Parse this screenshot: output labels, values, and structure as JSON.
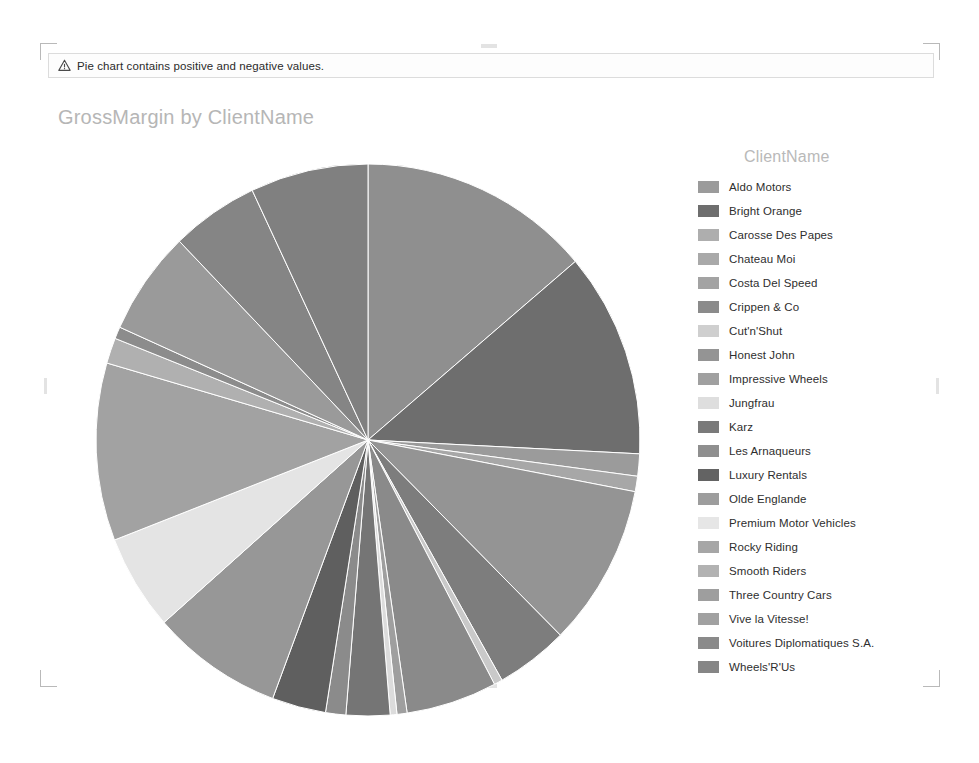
{
  "warning": {
    "icon": "warning-triangle-icon",
    "message": "Pie chart contains positive and negative values."
  },
  "chart_title": "GrossMargin by ClientName",
  "legend": {
    "title": "ClientName"
  },
  "colors": {
    "background": "#ffffff",
    "title_text": "#b6b6b6",
    "legend_title_text": "#b9b9b9",
    "legend_label_text": "#2e2e2e",
    "banner_border": "#dcdcdc",
    "selection_mark": "#b9b9b9"
  },
  "chart_data": {
    "type": "pie",
    "title": "GrossMargin by ClientName",
    "legend_title": "ClientName",
    "legend_position": "right",
    "value_field": "GrossMargin",
    "category_field": "ClientName",
    "note": "Pie chart contains positive and negative values.",
    "categories": [
      "Aldo Motors",
      "Bright Orange",
      "Carosse Des Papes",
      "Chateau Moi",
      "Costa Del Speed",
      "Crippen & Co",
      "Cut'n'Shut",
      "Honest John",
      "Impressive Wheels",
      "Jungfrau",
      "Karz",
      "Les Arnaqueurs",
      "Luxury Rentals",
      "Olde Englande",
      "Premium Motor Vehicles",
      "Rocky Riding",
      "Smooth Riders",
      "Three Country Cars",
      "Vive la Vitesse!",
      "Voitures Diplomatiques S.A.",
      "Wheels'R'Us"
    ],
    "values": [
      13.8,
      12.0,
      1.3,
      0.9,
      9.5,
      4.3,
      0.5,
      5.4,
      0.6,
      0.4,
      2.6,
      1.2,
      3.2,
      7.8,
      5.6,
      10.4,
      1.5,
      0.7,
      6.1,
      5.2,
      7.0
    ],
    "slice_colors": [
      "#8f8f8f",
      "#6e6e6e",
      "#9b9b9b",
      "#a7a7a7",
      "#949494",
      "#7d7d7d",
      "#c9c9c9",
      "#8a8a8a",
      "#9f9f9f",
      "#dcdcdc",
      "#757575",
      "#8b8b8b",
      "#5f5f5f",
      "#979797",
      "#e4e4e4",
      "#a2a2a2",
      "#b0b0b0",
      "#8c8c8c",
      "#9a9a9a",
      "#858585",
      "#808080"
    ],
    "legend_swatch_colors": [
      "#9b9b9b",
      "#6e6e6e",
      "#aeaeae",
      "#a9a9a9",
      "#a3a3a3",
      "#8b8b8b",
      "#cfcfcf",
      "#949494",
      "#a0a0a0",
      "#dedede",
      "#7a7a7a",
      "#8f8f8f",
      "#636363",
      "#9d9d9d",
      "#e6e6e6",
      "#a6a6a6",
      "#b2b2b2",
      "#9e9e9e",
      "#a1a1a1",
      "#8a8a8a",
      "#868686"
    ]
  }
}
